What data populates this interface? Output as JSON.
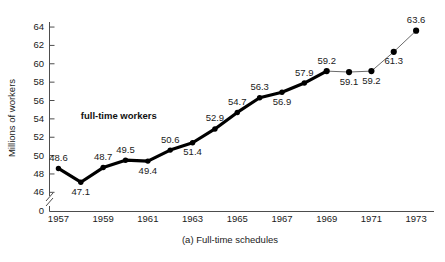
{
  "chart_data": {
    "type": "line",
    "title": "",
    "caption": "(a)  Full-time schedules",
    "xlabel": "",
    "ylabel": "Millions of workers",
    "ylim": [
      45,
      65
    ],
    "xlim": [
      1956.6,
      1973.8
    ],
    "grid": false,
    "legend_position": "none",
    "y_ticks": [
      46,
      48,
      50,
      52,
      54,
      56,
      58,
      60,
      62,
      64
    ],
    "y_tick_labels": [
      "46",
      "48",
      "50",
      "52",
      "54",
      "56",
      "58",
      "60",
      "62",
      "64"
    ],
    "y_axis_break": true,
    "y_axis_origin_label": "0",
    "x_ticks": [
      1957,
      1958,
      1959,
      1960,
      1961,
      1962,
      1963,
      1964,
      1965,
      1966,
      1967,
      1968,
      1969,
      1970,
      1971,
      1972,
      1973
    ],
    "x_tick_labels": [
      "1957",
      "",
      "1959",
      "",
      "1961",
      "",
      "1963",
      "",
      "1965",
      "",
      "1967",
      "",
      "1969",
      "",
      "1971",
      "",
      "1973"
    ],
    "annotations": [
      {
        "text": "full-time workers",
        "x": 1959.7,
        "y": 54.0
      }
    ],
    "series": [
      {
        "name": "full-time workers",
        "x": [
          1957,
          1958,
          1959,
          1960,
          1961,
          1962,
          1963,
          1964,
          1965,
          1966,
          1967,
          1968,
          1969,
          1970,
          1971,
          1972,
          1973
        ],
        "values": [
          48.6,
          47.1,
          48.7,
          49.5,
          49.4,
          50.6,
          51.4,
          52.9,
          54.7,
          56.3,
          56.9,
          57.9,
          59.2,
          59.1,
          59.2,
          61.3,
          63.6
        ],
        "point_labels": [
          "48.6",
          "47.1",
          "48.7",
          "49.5",
          "49.4",
          "50.6",
          "51.4",
          "52.9",
          "54.7",
          "56.3",
          "56.9",
          "57.9",
          "59.2",
          "59.1",
          "59.2",
          "61.3",
          "63.6"
        ],
        "label_positions": [
          "above",
          "below",
          "above",
          "above",
          "below",
          "above",
          "below",
          "above",
          "above",
          "above",
          "below",
          "above",
          "above",
          "below",
          "below",
          "below",
          "above"
        ],
        "emphasis_break_x": 1969,
        "emphasis_style": "thick-to-thin"
      }
    ]
  }
}
